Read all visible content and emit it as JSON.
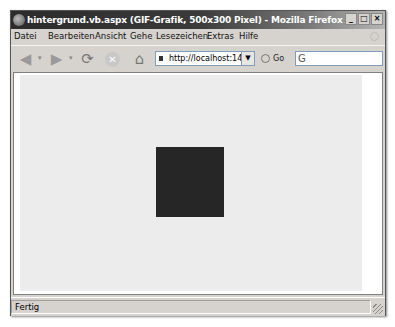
{
  "window": {
    "title": "hintergrund.vb.aspx (GIF-Grafik, 500x300 Pixel) - Mozilla Firefox",
    "controls": {
      "minimize": "_",
      "maximize": "□",
      "close": "×"
    }
  },
  "menubar": {
    "items": [
      {
        "label": "Datei"
      },
      {
        "label": "Bearbeiten"
      },
      {
        "label": "Ansicht"
      },
      {
        "label": "Gehe"
      },
      {
        "label": "Lesezeichen"
      },
      {
        "label": "Extras"
      },
      {
        "label": "Hilfe"
      }
    ]
  },
  "toolbar": {
    "back_icon": "◀",
    "forward_icon": "▶",
    "reload_icon": "⟳",
    "stop_icon": "✕",
    "home_icon": "⌂",
    "dropdown_glyph": "▾",
    "url": "http://localhost:1440",
    "url_dropdown": "▼",
    "go_label": "Go",
    "search_engine_glyph": "G",
    "search_value": ""
  },
  "content": {
    "image_background": "#ececec",
    "square_color": "#262626"
  },
  "statusbar": {
    "status_text": "Fertig"
  }
}
